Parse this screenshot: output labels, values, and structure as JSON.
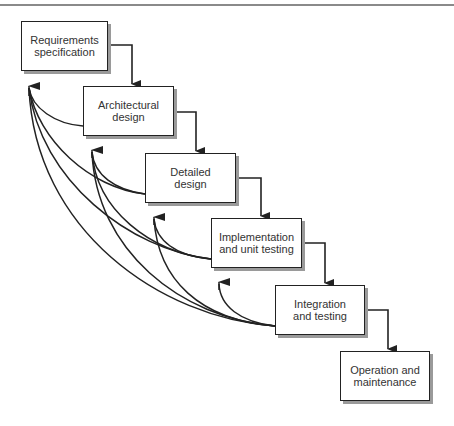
{
  "diagram": {
    "type": "waterfall-process-model",
    "stages": [
      {
        "id": "req",
        "label": "Requirements specification",
        "line1": "Requirements",
        "line2": "specification"
      },
      {
        "id": "arch",
        "label": "Architectural design",
        "line1": "Architectural",
        "line2": "design"
      },
      {
        "id": "det",
        "label": "Detailed design",
        "line1": "Detailed",
        "line2": "design"
      },
      {
        "id": "impl",
        "label": "Implementation and unit testing",
        "line1": "Implementation",
        "line2": "and unit testing"
      },
      {
        "id": "integ",
        "label": "Integration and testing",
        "line1": "Integration",
        "line2": "and testing"
      },
      {
        "id": "ops",
        "label": "Operation and maintenance",
        "line1": "Operation and",
        "line2": "maintenance"
      }
    ],
    "forward_edges": [
      [
        "req",
        "arch"
      ],
      [
        "arch",
        "det"
      ],
      [
        "det",
        "impl"
      ],
      [
        "impl",
        "integ"
      ],
      [
        "integ",
        "ops"
      ]
    ],
    "feedback_edges": [
      [
        "arch",
        "req"
      ],
      [
        "det",
        "req"
      ],
      [
        "det",
        "arch"
      ],
      [
        "impl",
        "req"
      ],
      [
        "impl",
        "arch"
      ],
      [
        "impl",
        "det"
      ],
      [
        "integ",
        "req"
      ],
      [
        "integ",
        "arch"
      ],
      [
        "integ",
        "det"
      ],
      [
        "integ",
        "impl"
      ]
    ],
    "colors": {
      "stroke": "#222222",
      "shadow": "#9a9a9a",
      "text": "#333333",
      "background": "#ffffff"
    }
  }
}
